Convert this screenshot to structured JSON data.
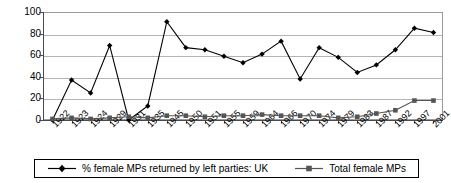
{
  "chart_data": {
    "type": "line",
    "title": "",
    "xlabel": "",
    "ylabel": "",
    "ylim": [
      0,
      100
    ],
    "ytick_step": 20,
    "grid": true,
    "legend_position": "bottom",
    "categories": [
      "1922",
      "1923",
      "1924",
      "1929",
      "1931",
      "1935",
      "1945",
      "1950",
      "1951",
      "1955",
      "1959",
      "1964",
      "1966",
      "1970",
      "1974",
      "1979",
      "1983",
      "1987",
      "1992",
      "1997",
      "2001"
    ],
    "series": [
      {
        "name": "% female MPs returned by left parties: UK",
        "marker": "diamond",
        "color": "#000000",
        "values": [
          0,
          37,
          25,
          69,
          0,
          13,
          91,
          67,
          65,
          59,
          53,
          61,
          73,
          38,
          67,
          58,
          44,
          51,
          65,
          85,
          81
        ]
      },
      {
        "name": "Total female MPs",
        "marker": "square",
        "color": "#555555",
        "values": [
          1,
          2,
          1,
          2,
          3,
          2,
          4,
          4,
          3,
          4,
          4,
          5,
          4,
          4,
          4,
          2,
          3,
          6,
          9,
          18,
          18
        ]
      }
    ],
    "ytick_labels": [
      "0",
      "20",
      "40",
      "60",
      "80",
      "100"
    ]
  },
  "legend": {
    "entries": [
      {
        "label": "% female MPs returned by left parties: UK",
        "marker": "diamond"
      },
      {
        "label": "Total female MPs",
        "marker": "square"
      }
    ]
  }
}
